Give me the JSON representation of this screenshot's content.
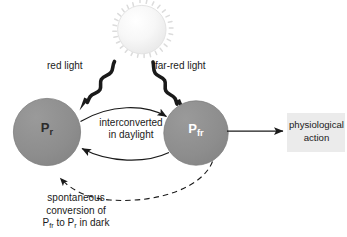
{
  "diagram": {
    "canvas": {
      "width": 347,
      "height": 237,
      "background": "#ffffff"
    },
    "colors": {
      "circle_fill": "#8e8e8e",
      "circle_stroke": "#7a7a7a",
      "sun_fill": "#f4f4f4",
      "sun_stroke": "#e0e0e0",
      "box_fill": "#ebebeb",
      "text": "#1a1a1a",
      "pr_text": "#2b2b2b",
      "pfr_text": "#ffffff",
      "arrow": "#1a1a1a",
      "squiggle": "#1a1a1a",
      "dashed": "#3a3a3a"
    },
    "nodes": {
      "sun": {
        "label": "",
        "icon": "sun-icon",
        "cx": 140,
        "cy": 30,
        "r": 24
      },
      "pr_circle": {
        "label_main": "P",
        "label_sub": "r",
        "cx": 47,
        "cy": 132,
        "r": 34
      },
      "pfr_circle": {
        "label_main": "P",
        "label_sub": "fr",
        "cx": 196,
        "cy": 133,
        "r": 32
      },
      "physiological_box": {
        "line1": "physiological",
        "line2": "action",
        "x": 287,
        "y": 113,
        "width": 58,
        "height": 39
      }
    },
    "labels": {
      "red_light": "red light",
      "far_red_light": "far-red light",
      "interconverted_line1": "interconverted",
      "interconverted_line2": "in daylight",
      "spontaneous_line1": "spontaneous",
      "spontaneous_line2": "conversion of",
      "spontaneous_line3_a": "P",
      "spontaneous_line3_a_sub": "fr",
      "spontaneous_line3_b": " to P",
      "spontaneous_line3_b_sub": "r",
      "spontaneous_line3_c": " in dark"
    },
    "edges": [
      {
        "name": "red-light-squiggle-arrow",
        "from": "sun",
        "to": "pr_circle",
        "style": "wavy-thick-arrow",
        "label": "red light"
      },
      {
        "name": "far-red-light-squiggle-arrow",
        "from": "sun",
        "to": "pfr_circle",
        "style": "wavy-thick-arrow",
        "label": "far-red light"
      },
      {
        "name": "pr-to-pfr-arc-arrow",
        "from": "pr_circle",
        "to": "pfr_circle",
        "style": "curved-arrow",
        "label": "interconverted in daylight"
      },
      {
        "name": "pfr-to-pr-arc-arrow",
        "from": "pfr_circle",
        "to": "pr_circle",
        "style": "curved-arrow",
        "label": "interconverted in daylight"
      },
      {
        "name": "pfr-to-physiological-arrow",
        "from": "pfr_circle",
        "to": "physiological_box",
        "style": "straight-arrow",
        "label": ""
      },
      {
        "name": "pfr-to-pr-dashed-arrow",
        "from": "pfr_circle",
        "to": "pr_circle",
        "style": "dashed-curved-arrow",
        "label": "spontaneous conversion of Pfr to Pr in dark"
      }
    ]
  }
}
